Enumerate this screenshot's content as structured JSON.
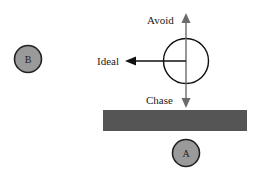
{
  "labels": {
    "avoid": "Avoid",
    "ideal": "Ideal",
    "chase": "Chase"
  },
  "nodes": {
    "b": "B",
    "a": "A"
  },
  "colors": {
    "node_fill": "#9a9a9a",
    "node_stroke": "#222222",
    "bar_fill": "#555555",
    "arrow_gray": "#6b6b6b",
    "arrow_black": "#111111",
    "circle_stroke": "#111111"
  }
}
